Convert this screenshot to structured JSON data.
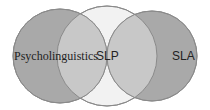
{
  "diagram": {
    "type": "venn",
    "sets": [
      {
        "label": "Psycholinguistics",
        "color": "#a9a9a9"
      },
      {
        "label": "SLP",
        "color": "#cfcfcf"
      },
      {
        "label": "SLA",
        "color": "#a9a9a9"
      }
    ],
    "background": "#ffffff",
    "outline_color": "#8a8a8a",
    "overlap_color": "#c4c4c4",
    "uncovered_middle_color": "#f2f2f2"
  }
}
